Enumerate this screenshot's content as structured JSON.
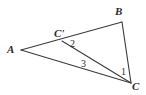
{
  "figure": {
    "type": "geometry-diagram",
    "shape": "triangle",
    "background_color": "#ffffff",
    "stroke_color": "#3a3a3a",
    "label_color": "#2b2b2b",
    "width": 146,
    "height": 95
  },
  "points": {
    "A": {
      "label": "A",
      "x": 21,
      "y": 50
    },
    "B": {
      "label": "B",
      "x": 122,
      "y": 22
    },
    "C": {
      "label": "C",
      "x": 131,
      "y": 83
    },
    "Cprime": {
      "label": "C'",
      "x": 62,
      "y": 41
    }
  },
  "segments": [
    {
      "name": "A-to-B",
      "from": "A",
      "to": "B"
    },
    {
      "name": "B-to-C",
      "from": "B",
      "to": "C"
    },
    {
      "name": "A-to-C",
      "from": "A",
      "to": "C"
    },
    {
      "name": "Cprime-to-C",
      "from": "Cprime",
      "to": "C"
    }
  ],
  "angles": {
    "one": {
      "label": "1",
      "at": "C",
      "x": 124,
      "y": 72
    },
    "two": {
      "label": "2",
      "at": "Cprime",
      "x": 73,
      "y": 44
    },
    "three": {
      "label": "3",
      "at": "C",
      "x": 84,
      "y": 64
    }
  }
}
